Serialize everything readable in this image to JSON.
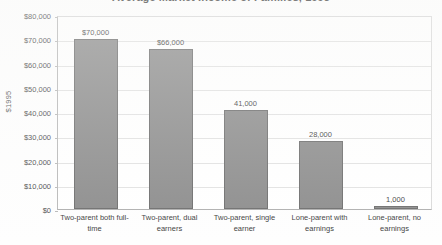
{
  "chart_data": {
    "type": "bar",
    "title": "Average Market Income of Families, 1995",
    "xlabel": "",
    "ylabel": "$1995",
    "ylim": [
      0,
      80000
    ],
    "grid": true,
    "legend": "none",
    "categories": [
      "Two-parent both full-time",
      "Two-parent, dual earners",
      "Two-parent, single earner",
      "Lone-parent with earnings",
      "Lone-parent, no earnings"
    ],
    "values": [
      70000,
      66000,
      41000,
      28000,
      1000
    ],
    "data_labels": [
      "$70,000",
      "$66,000",
      "41,000",
      "28,000",
      "1,000"
    ],
    "ytick_values": [
      0,
      10000,
      20000,
      30000,
      40000,
      50000,
      60000,
      70000,
      80000
    ],
    "ytick_labels": [
      "$0",
      "$10,000",
      "$20,000",
      "$30,000",
      "$40,000",
      "$50,000",
      "$60,000",
      "$70,000",
      "$80,000"
    ],
    "series_color": "#8e8e8e",
    "series_border_color": "#6f6f6f",
    "gridline_color": "#e2e2e2",
    "axis_color": "#b9b9b9"
  }
}
